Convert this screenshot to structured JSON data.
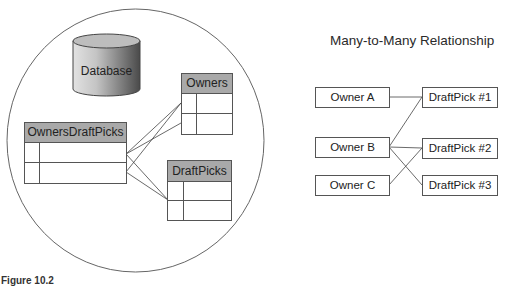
{
  "left_diagram": {
    "database_label": "Database",
    "tables": [
      {
        "name": "OwnersDraftPicks",
        "rows": 2
      },
      {
        "name": "Owners",
        "rows": 2
      },
      {
        "name": "DraftPicks",
        "rows": 2
      }
    ],
    "colors": {
      "header": "#a9a9a9",
      "line": "#555555",
      "circle": "#666666"
    }
  },
  "right_diagram": {
    "title": "Many-to-Many Relationship",
    "owners": [
      "Owner A",
      "Owner B",
      "Owner C"
    ],
    "draft_picks": [
      "DraftPick #1",
      "DraftPick #2",
      "DraftPick #3"
    ],
    "links": [
      [
        "Owner A",
        "DraftPick #1"
      ],
      [
        "Owner B",
        "DraftPick #1"
      ],
      [
        "Owner B",
        "DraftPick #2"
      ],
      [
        "Owner B",
        "DraftPick #3"
      ],
      [
        "Owner C",
        "DraftPick #2"
      ]
    ]
  },
  "caption": "Figure 10.2"
}
